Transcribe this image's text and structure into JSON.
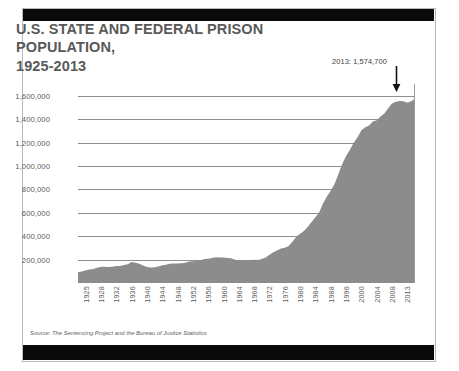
{
  "chart_data": {
    "type": "area",
    "title": "U.S. STATE AND FEDERAL PRISON POPULATION, 1925-2013",
    "title_line1": "U.S. STATE AND FEDERAL PRISON POPULATION,",
    "title_line2": "1925-2013",
    "xlabel": "",
    "ylabel": "",
    "ylim": [
      0,
      1700000
    ],
    "xlim": [
      1925,
      2013
    ],
    "grid": true,
    "legend": "none",
    "fill_color": "#8c8c8c",
    "grid_color": "#8f8f8f",
    "text_color": "#595959",
    "ytick_labels": [
      "1,600,000",
      "1,400,000",
      "1,200,000",
      "1,000,000",
      "800,000",
      "600,000",
      "400,000",
      "200,000"
    ],
    "ytick_values": [
      1600000,
      1400000,
      1200000,
      1000000,
      800000,
      600000,
      400000,
      200000
    ],
    "xtick_labels": [
      "1925",
      "1928",
      "1932",
      "1936",
      "1940",
      "1944",
      "1948",
      "1952",
      "1956",
      "1960",
      "1964",
      "1968",
      "1972",
      "1976",
      "1980",
      "1984",
      "1988",
      "1996",
      "2000",
      "2004",
      "2008",
      "2013"
    ],
    "annotation": {
      "text": "2013: 1,574,700",
      "year": 2013,
      "value": 1574700,
      "marker": "down-arrow"
    },
    "x": [
      1925,
      1926,
      1927,
      1928,
      1929,
      1930,
      1931,
      1932,
      1933,
      1934,
      1935,
      1936,
      1937,
      1938,
      1939,
      1940,
      1941,
      1942,
      1943,
      1944,
      1945,
      1946,
      1947,
      1948,
      1949,
      1950,
      1951,
      1952,
      1953,
      1954,
      1955,
      1956,
      1957,
      1958,
      1959,
      1960,
      1961,
      1962,
      1963,
      1964,
      1965,
      1966,
      1967,
      1968,
      1969,
      1970,
      1971,
      1972,
      1973,
      1974,
      1975,
      1976,
      1977,
      1978,
      1979,
      1980,
      1981,
      1982,
      1983,
      1984,
      1985,
      1986,
      1987,
      1988,
      1989,
      1990,
      1991,
      1992,
      1993,
      1994,
      1995,
      1996,
      1997,
      1998,
      1999,
      2000,
      2001,
      2002,
      2003,
      2004,
      2005,
      2006,
      2007,
      2008,
      2009,
      2010,
      2011,
      2012,
      2013
    ],
    "values": [
      91669,
      97991,
      109983,
      116390,
      120496,
      129453,
      137997,
      137997,
      136810,
      138316,
      144180,
      145038,
      152741,
      160285,
      179818,
      173706,
      165439,
      150384,
      137220,
      132456,
      133649,
      140079,
      151304,
      155977,
      163749,
      166123,
      165680,
      168233,
      173579,
      182901,
      185780,
      189735,
      195414,
      205643,
      208105,
      212953,
      220149,
      218830,
      217283,
      214336,
      210895,
      199654,
      194896,
      187914,
      196007,
      196429,
      198061,
      196092,
      204211,
      218466,
      240593,
      262833,
      278141,
      294396,
      301470,
      315974,
      353167,
      394374,
      419820,
      443398,
      480568,
      522084,
      560812,
      603732,
      680907,
      739980,
      789610,
      846277,
      932074,
      1016691,
      1085022,
      1138984,
      1197590,
      1245402,
      1304074,
      1331278,
      1345217,
      1380516,
      1390279,
      1421345,
      1448344,
      1492973,
      1532851,
      1547742,
      1555600,
      1552669,
      1538847,
      1553574,
      1574700
    ],
    "peak_value": 1555600,
    "peak_year": 2009,
    "final_value": 1574700
  },
  "source": {
    "prefix": "Source:",
    "text": "Source: The Sentencing Project and the Bureau of Justice Statistics"
  }
}
